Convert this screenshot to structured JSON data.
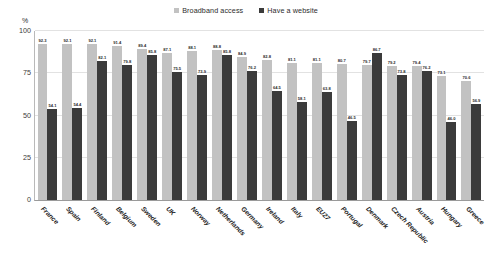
{
  "legend": {
    "items": [
      {
        "label": "Broadband access",
        "color": "#c2c2c2"
      },
      {
        "label": "Have a website",
        "color": "#3b3b3b"
      }
    ]
  },
  "axis": {
    "unit": "%",
    "yticks": [
      "100",
      "75",
      "50",
      "25",
      "0"
    ]
  },
  "chart_data": {
    "type": "bar",
    "title": "",
    "subtitle": "",
    "xlabel": "",
    "ylabel": "%",
    "ylim": [
      0,
      100
    ],
    "yticks": [
      0,
      25,
      50,
      75,
      100
    ],
    "grid": true,
    "legend_position": "top-center",
    "categories": [
      "France",
      "Spain",
      "Finland",
      "Belgium",
      "Sweden",
      "UK",
      "Norway",
      "Netherlands",
      "Germany",
      "Ireland",
      "Italy",
      "EU27",
      "Portugal",
      "Denmark",
      "Czech Republic",
      "Austria",
      "Hungary",
      "Greece"
    ],
    "series": [
      {
        "name": "Broadband access",
        "color": "#c2c2c2",
        "values": [
          92.3,
          92.1,
          92.1,
          91.4,
          89.4,
          87.1,
          88.1,
          88.8,
          84.9,
          82.8,
          81.1,
          81.1,
          80.7,
          79.7,
          79.2,
          79.4,
          73.1,
          70.6
        ]
      },
      {
        "name": "Have a website",
        "color": "#3b3b3b",
        "values": [
          54.1,
          54.4,
          82.1,
          79.8,
          85.8,
          75.5,
          73.9,
          85.8,
          76.2,
          64.5,
          58.1,
          63.8,
          46.5,
          86.7,
          73.8,
          76.2,
          46.0,
          56.9
        ]
      }
    ]
  }
}
